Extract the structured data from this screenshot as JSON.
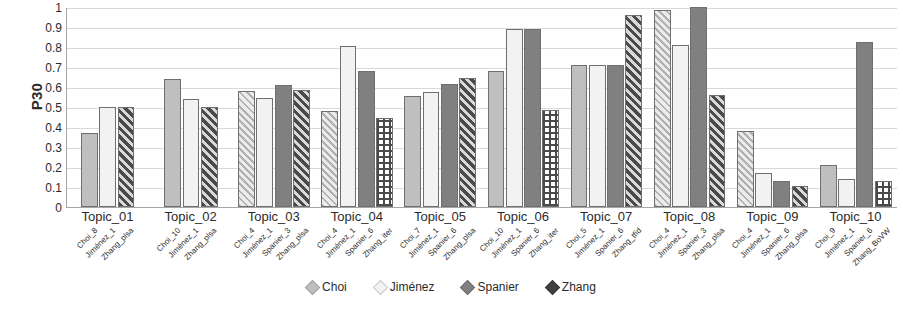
{
  "chart_data": {
    "type": "bar",
    "title": "",
    "xlabel": "",
    "ylabel": "P30",
    "ylim": [
      0,
      1
    ],
    "ytick_labels": [
      "1",
      "0.9",
      "0.8",
      "0.7",
      "0.6",
      "0.5",
      "0.4",
      "0.3",
      "0.2",
      "0.1",
      "0"
    ],
    "ytick_values": [
      1,
      0.9,
      0.8,
      0.7,
      0.6,
      0.5,
      0.4,
      0.3,
      0.2,
      0.1,
      0
    ],
    "grid": "horizontal",
    "legend_position": "bottom-center",
    "categories": [
      "Topic_01",
      "Topic_02",
      "Topic_03",
      "Topic_04",
      "Topic_05",
      "Topic_06",
      "Topic_07",
      "Topic_08",
      "Topic_09",
      "Topic_10"
    ],
    "legend": [
      {
        "name": "Choi",
        "color": "#bfbfbf"
      },
      {
        "name": "Jiménez",
        "color": "#f2f2f2"
      },
      {
        "name": "Spanier",
        "color": "#808080"
      },
      {
        "name": "Zhang",
        "color": "#404040"
      }
    ],
    "series": [
      {
        "name": "Choi",
        "values": [
          0.37,
          0.64,
          0.58,
          0.48,
          0.555,
          0.68,
          0.71,
          0.985,
          0.38,
          0.21
        ]
      },
      {
        "name": "Jiménez",
        "values": [
          0.5,
          0.54,
          0.545,
          0.805,
          0.575,
          0.89,
          0.71,
          0.81,
          0.17,
          0.14
        ]
      },
      {
        "name": "Spanier",
        "values": [
          null,
          null,
          0.61,
          0.68,
          0.615,
          0.89,
          0.71,
          1.0,
          0.13,
          0.825
        ]
      },
      {
        "name": "Zhang",
        "values": [
          0.5,
          0.5,
          0.585,
          0.445,
          0.645,
          0.485,
          0.96,
          0.56,
          0.105,
          0.13
        ]
      }
    ],
    "groups": [
      {
        "category": "Topic_01",
        "bars": [
          {
            "series": "Choi",
            "label": "Choi_8",
            "value": 0.37,
            "pattern": "p-solid-light"
          },
          {
            "series": "Jiménez",
            "label": "Jiménez_1",
            "value": 0.5,
            "pattern": "p-solid-pale"
          },
          {
            "series": "Zhang",
            "label": "Zhang_plsa",
            "value": 0.5,
            "pattern": "p-hatch-dark"
          }
        ]
      },
      {
        "category": "Topic_02",
        "bars": [
          {
            "series": "Choi",
            "label": "Choi_10",
            "value": 0.64,
            "pattern": "p-solid-light"
          },
          {
            "series": "Jiménez",
            "label": "Jiménez_1",
            "value": 0.54,
            "pattern": "p-solid-pale"
          },
          {
            "series": "Zhang",
            "label": "Zhang_plsa",
            "value": 0.5,
            "pattern": "p-hatch-dark"
          }
        ]
      },
      {
        "category": "Topic_03",
        "bars": [
          {
            "series": "Choi",
            "label": "Choi_4",
            "value": 0.58,
            "pattern": "p-hatch-light"
          },
          {
            "series": "Jiménez",
            "label": "Jiménez_1",
            "value": 0.545,
            "pattern": "p-solid-pale"
          },
          {
            "series": "Spanier",
            "label": "Spanier_3",
            "value": 0.61,
            "pattern": "p-solid-mid"
          },
          {
            "series": "Zhang",
            "label": "Zhang_plsa",
            "value": 0.585,
            "pattern": "p-hatch-dark"
          }
        ]
      },
      {
        "category": "Topic_04",
        "bars": [
          {
            "series": "Choi",
            "label": "Choi_4",
            "value": 0.48,
            "pattern": "p-hatch-light"
          },
          {
            "series": "Jiménez",
            "label": "Jiménez_1",
            "value": 0.805,
            "pattern": "p-solid-pale"
          },
          {
            "series": "Spanier",
            "label": "Spanier_6",
            "value": 0.68,
            "pattern": "p-solid-mid"
          },
          {
            "series": "Zhang",
            "label": "Zhang_iter",
            "value": 0.445,
            "pattern": "p-check-dark"
          }
        ]
      },
      {
        "category": "Topic_05",
        "bars": [
          {
            "series": "Choi",
            "label": "Choi_7",
            "value": 0.555,
            "pattern": "p-solid-light"
          },
          {
            "series": "Jiménez",
            "label": "Jiménez_1",
            "value": 0.575,
            "pattern": "p-solid-pale"
          },
          {
            "series": "Spanier",
            "label": "Spanier_6",
            "value": 0.615,
            "pattern": "p-solid-mid"
          },
          {
            "series": "Zhang",
            "label": "Zhang_plsa",
            "value": 0.645,
            "pattern": "p-hatch-dark"
          }
        ]
      },
      {
        "category": "Topic_06",
        "bars": [
          {
            "series": "Choi",
            "label": "Choi_10",
            "value": 0.68,
            "pattern": "p-solid-light"
          },
          {
            "series": "Jiménez",
            "label": "Jiménez_1",
            "value": 0.89,
            "pattern": "p-solid-pale"
          },
          {
            "series": "Spanier",
            "label": "Spanier_6",
            "value": 0.89,
            "pattern": "p-solid-mid"
          },
          {
            "series": "Zhang",
            "label": "Zhang_iter",
            "value": 0.485,
            "pattern": "p-check-dark"
          }
        ]
      },
      {
        "category": "Topic_07",
        "bars": [
          {
            "series": "Choi",
            "label": "Choi_5",
            "value": 0.71,
            "pattern": "p-solid-light"
          },
          {
            "series": "Jiménez",
            "label": "Jiménez_1",
            "value": 0.71,
            "pattern": "p-solid-pale"
          },
          {
            "series": "Spanier",
            "label": "Spanier_6",
            "value": 0.71,
            "pattern": "p-solid-mid"
          },
          {
            "series": "Zhang",
            "label": "Zhang_tfid",
            "value": 0.96,
            "pattern": "p-hatch-dark"
          }
        ]
      },
      {
        "category": "Topic_08",
        "bars": [
          {
            "series": "Choi",
            "label": "Choi_4",
            "value": 0.985,
            "pattern": "p-hatch-light"
          },
          {
            "series": "Jiménez",
            "label": "Jiménez_1",
            "value": 0.81,
            "pattern": "p-solid-pale"
          },
          {
            "series": "Spanier",
            "label": "Spanier_3",
            "value": 1.0,
            "pattern": "p-solid-mid"
          },
          {
            "series": "Zhang",
            "label": "Zhang_plsa",
            "value": 0.56,
            "pattern": "p-hatch-dark"
          }
        ]
      },
      {
        "category": "Topic_09",
        "bars": [
          {
            "series": "Choi",
            "label": "Choi_4",
            "value": 0.38,
            "pattern": "p-hatch-light"
          },
          {
            "series": "Jiménez",
            "label": "Jiménez_1",
            "value": 0.17,
            "pattern": "p-solid-pale"
          },
          {
            "series": "Spanier",
            "label": "Spanier_6",
            "value": 0.13,
            "pattern": "p-solid-mid"
          },
          {
            "series": "Zhang",
            "label": "Zhang_plsa",
            "value": 0.105,
            "pattern": "p-hatch-dark"
          }
        ]
      },
      {
        "category": "Topic_10",
        "bars": [
          {
            "series": "Choi",
            "label": "Choi_9",
            "value": 0.21,
            "pattern": "p-solid-light"
          },
          {
            "series": "Jiménez",
            "label": "Jiménez_1",
            "value": 0.14,
            "pattern": "p-solid-pale"
          },
          {
            "series": "Spanier",
            "label": "Spanier_6",
            "value": 0.825,
            "pattern": "p-solid-mid"
          },
          {
            "series": "Zhang",
            "label": "Zhang_BoVW",
            "value": 0.13,
            "pattern": "p-check-dark"
          }
        ]
      }
    ]
  }
}
